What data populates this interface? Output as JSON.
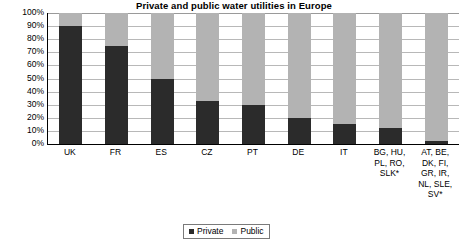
{
  "chart_data": {
    "type": "bar",
    "subtype": "stacked-100-percent",
    "title": "Private and public water utilities in Europe",
    "xlabel": "",
    "ylabel": "",
    "ylim": [
      0,
      100
    ],
    "ytick_labels": [
      "100%",
      "90%",
      "80%",
      "70%",
      "60%",
      "50%",
      "40%",
      "30%",
      "20%",
      "10%",
      "0%"
    ],
    "ytick_values": [
      100,
      90,
      80,
      70,
      60,
      50,
      40,
      30,
      20,
      10,
      0
    ],
    "grid": true,
    "legend_position": "bottom-center",
    "categories": [
      "UK",
      "FR",
      "ES",
      "CZ",
      "PT",
      "DE",
      "IT",
      "BG, HU, PL, RO, SLK*",
      "AT, BE, DK, FI, GR, IR, NL, SLE, SV*"
    ],
    "category_display": [
      "UK",
      "FR",
      "ES",
      "CZ",
      "PT",
      "DE",
      "IT",
      "BG, HU,\nPL, RO,\nSLK*",
      "AT, BE,\nDK, FI,\nGR, IR,\nNL, SLE,\nSV*"
    ],
    "series": [
      {
        "name": "Private",
        "color": "#2b2b2b",
        "values": [
          90,
          75,
          50,
          33,
          30,
          20,
          15,
          12,
          2
        ]
      },
      {
        "name": "Public",
        "color": "#b3b3b3",
        "values": [
          10,
          25,
          50,
          67,
          70,
          80,
          85,
          88,
          98
        ]
      }
    ]
  },
  "legend": {
    "items": [
      {
        "label": "Private",
        "color": "#2b2b2b"
      },
      {
        "label": "Public",
        "color": "#b3b3b3"
      }
    ]
  },
  "colors": {
    "private": "#2b2b2b",
    "public": "#b3b3b3",
    "gridline": "#b8b8b8",
    "axis": "#000000",
    "background": "#ffffff"
  }
}
